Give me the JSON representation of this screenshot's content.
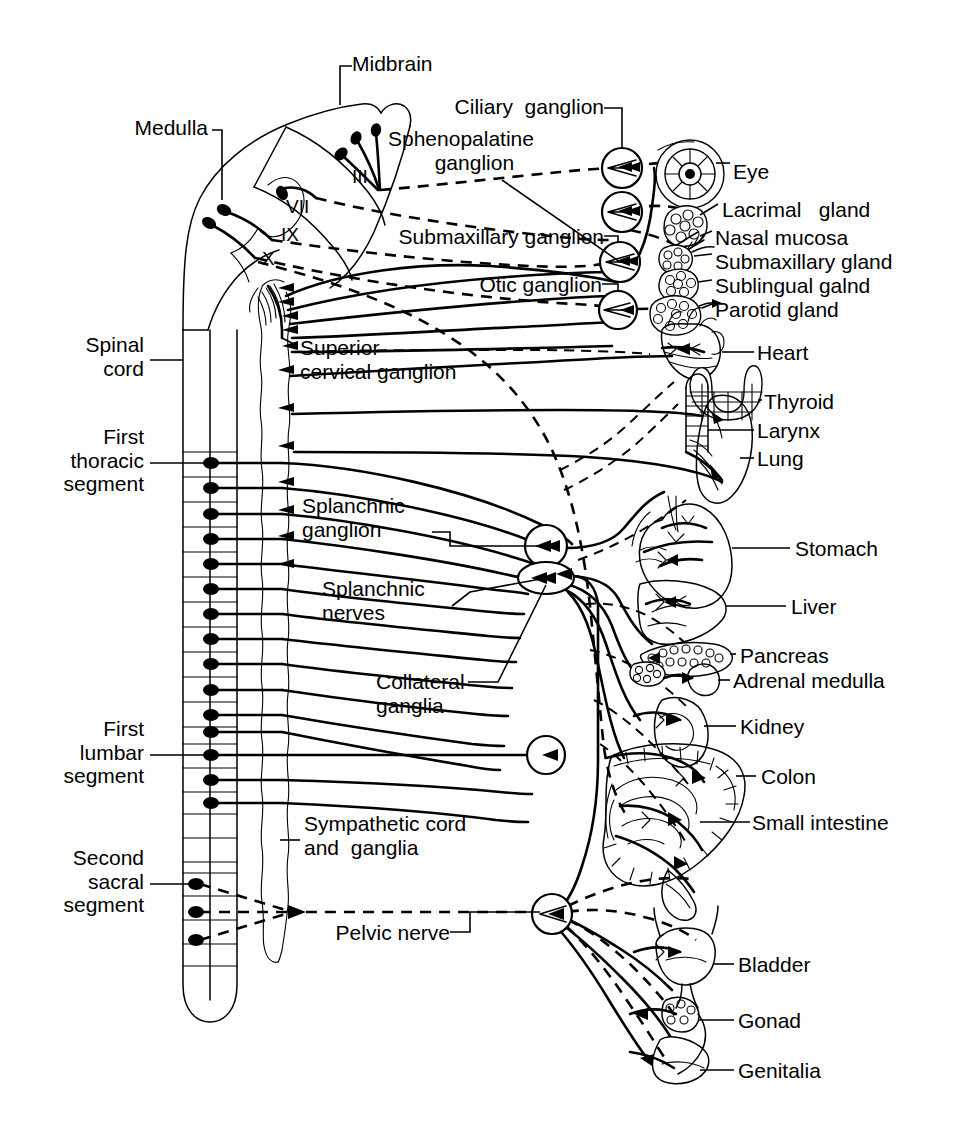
{
  "figure": {
    "kind": "anatomical-schematic",
    "background_color": "#ffffff",
    "ink_color": "#000000",
    "width": 953,
    "height": 1129
  },
  "cns_labels": {
    "midbrain": "Midbrain",
    "medulla": "Medulla",
    "spinal_cord": "Spinal\ncord",
    "first_thoracic": "First\nthoracic\nsegment",
    "first_lumbar": "First\nlumbar\nsegment",
    "second_sacral": "Second\nsacral\nsegment"
  },
  "cranial_nerves": [
    {
      "numeral": "III",
      "x": 352,
      "y": 178
    },
    {
      "numeral": "VII",
      "x": 288,
      "y": 207
    },
    {
      "numeral": "IX",
      "x": 283,
      "y": 235
    },
    {
      "numeral": "X",
      "x": 264,
      "y": 258
    }
  ],
  "ganglion_labels": {
    "ciliary": "Ciliary  ganglion",
    "sphenopalatine": "Sphenopalatine\n        ganglion",
    "submaxillary": "Submaxillary ganglion",
    "otic": "Otic ganglion",
    "superior_cervical": "Superior\ncervical ganglion",
    "splanchnic_ganglion": "Splanchnic\nganglion",
    "splanchnic_nerves": "Splanchnic\nnerves",
    "collateral": "Collateral\nganglia",
    "sympathetic_cord": "Sympathetic cord\nand  ganglia",
    "pelvic_nerve": "Pelvic nerve"
  },
  "organs": [
    {
      "name": "Eye",
      "label": "Eye",
      "label_x": 733,
      "label_y": 160
    },
    {
      "name": "Lacrimal gland",
      "label": "Lacrimal   gland",
      "label_x": 722,
      "label_y": 198
    },
    {
      "name": "Nasal mucosa",
      "label": "Nasal mucosa",
      "label_x": 715,
      "label_y": 226
    },
    {
      "name": "Submaxillary gland",
      "label": "Submaxillary gland",
      "label_x": 715,
      "label_y": 250
    },
    {
      "name": "Sublingual gland",
      "label": "Sublingual galnd",
      "label_x": 715,
      "label_y": 275
    },
    {
      "name": "Parotid gland",
      "label": "Parotid gland",
      "label_x": 715,
      "label_y": 299
    },
    {
      "name": "Heart",
      "label": "Heart",
      "label_x": 757,
      "label_y": 348
    },
    {
      "name": "Thyroid",
      "label": "Thyroid",
      "label_x": 762,
      "label_y": 397
    },
    {
      "name": "Larynx",
      "label": "Larynx",
      "label_x": 757,
      "label_y": 427
    },
    {
      "name": "Lung",
      "label": "Lung",
      "label_x": 757,
      "label_y": 455
    },
    {
      "name": "Stomach",
      "label": "Stomach",
      "label_x": 795,
      "label_y": 542
    },
    {
      "name": "Liver",
      "label": "Liver",
      "label_x": 790,
      "label_y": 601
    },
    {
      "name": "Pancreas",
      "label": "Pancreas",
      "label_x": 740,
      "label_y": 650
    },
    {
      "name": "Adrenal medulla",
      "label": "Adrenal medulla",
      "label_x": 733,
      "label_y": 676
    },
    {
      "name": "Kidney",
      "label": "Kidney",
      "label_x": 740,
      "label_y": 721
    },
    {
      "name": "Colon",
      "label": "Colon",
      "label_x": 760,
      "label_y": 771
    },
    {
      "name": "Small intestine",
      "label": "Small intestine",
      "label_x": 754,
      "label_y": 818
    },
    {
      "name": "Bladder",
      "label": "Bladder",
      "label_x": 738,
      "label_y": 960
    },
    {
      "name": "Gonad",
      "label": "Gonad",
      "label_x": 738,
      "label_y": 1016
    },
    {
      "name": "Genitalia",
      "label": "Genitalia",
      "label_x": 738,
      "label_y": 1066
    }
  ],
  "spinal_segments": {
    "thoracic_roots": 12,
    "lumbar_roots": 3,
    "sacral_roots": 3,
    "note_first_thoracic_y": 463,
    "note_first_lumbar_y": 755,
    "note_second_sacral_y": 884
  },
  "line_styles": {
    "solid": "sympathetic / preganglionic-postganglionic solid nerve path",
    "dashed": "parasympathetic (craniosacral) outflow"
  }
}
